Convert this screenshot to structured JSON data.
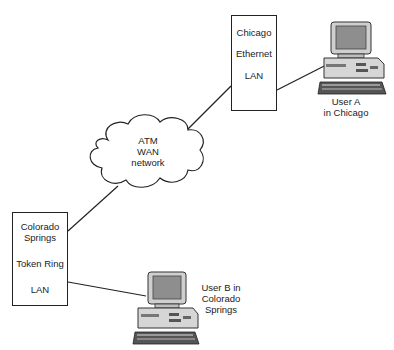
{
  "diagram": {
    "nodes": {
      "chicago_lan": {
        "lines": [
          "Chicago",
          "Ethernet",
          "LAN"
        ]
      },
      "wan": {
        "lines": [
          "ATM",
          "WAN",
          "network"
        ]
      },
      "colorado_lan": {
        "lines": [
          "Colorado",
          "Springs",
          "Token Ring",
          "LAN"
        ]
      },
      "user_a": {
        "lines": [
          "User A",
          "in Chicago"
        ],
        "icon": "desktop-computer-icon"
      },
      "user_b": {
        "lines": [
          "User B in",
          "Colorado",
          "Springs"
        ],
        "icon": "desktop-computer-icon"
      }
    },
    "edges": [
      {
        "from": "user_a",
        "to": "chicago_lan"
      },
      {
        "from": "chicago_lan",
        "to": "wan"
      },
      {
        "from": "wan",
        "to": "colorado_lan"
      },
      {
        "from": "colorado_lan",
        "to": "user_b"
      }
    ],
    "colors": {
      "line": "#222222",
      "background": "#ffffff"
    }
  }
}
